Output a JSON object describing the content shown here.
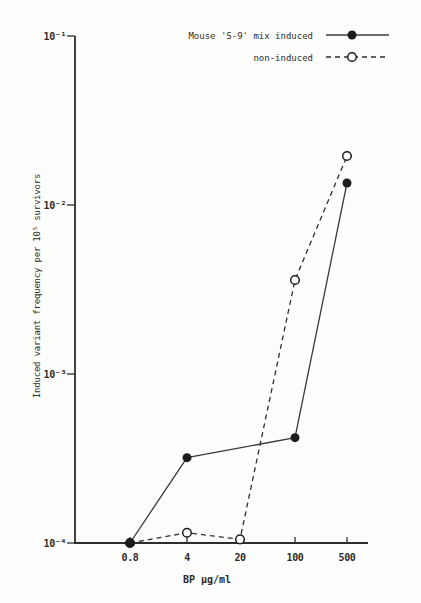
{
  "colors": {
    "ink": "#2d2d2d",
    "line_solid": "#3a3a3a",
    "line_dashed": "#2e2e2e",
    "marker_fill": "#1c1c1c",
    "marker_open_fill": "#fdfdfb",
    "background": "#fdfdfb"
  },
  "chart_data": {
    "type": "line",
    "title": "",
    "xlabel": "BP μg/ml",
    "ylabel": "Induced variant frequency per 10⁵ survivors",
    "x_scale": "ordinal-log (each tick is 5× previous)",
    "y_scale": "log",
    "ylim": [
      0.0001,
      0.1
    ],
    "grid": false,
    "legend_position": "top-right",
    "categories": [
      0.8,
      4,
      20,
      100,
      500
    ],
    "x_tick_labels": [
      "0.8",
      "4",
      "20",
      "100",
      "500"
    ],
    "y_ticks": [
      {
        "label": "10⁻¹",
        "value": 0.1
      },
      {
        "label": "10⁻²",
        "value": 0.01
      },
      {
        "label": "10⁻³",
        "value": 0.001
      },
      {
        "label": "10⁻⁴",
        "value": 0.0001
      }
    ],
    "series": [
      {
        "name": "Mouse 'S-9' mix induced",
        "line": "solid",
        "marker": "filled-circle",
        "points": [
          {
            "x": 0.8,
            "y": 0.0001
          },
          {
            "x": 4,
            "y": 0.00032
          },
          {
            "x": 100,
            "y": 0.00042
          },
          {
            "x": 500,
            "y": 0.0135
          }
        ]
      },
      {
        "name": "non-induced",
        "line": "dashed",
        "marker": "open-circle",
        "points": [
          {
            "x": 0.8,
            "y": 0.0001
          },
          {
            "x": 4,
            "y": 0.000115
          },
          {
            "x": 20,
            "y": 0.000105
          },
          {
            "x": 100,
            "y": 0.0036
          },
          {
            "x": 500,
            "y": 0.0195
          }
        ]
      }
    ]
  }
}
